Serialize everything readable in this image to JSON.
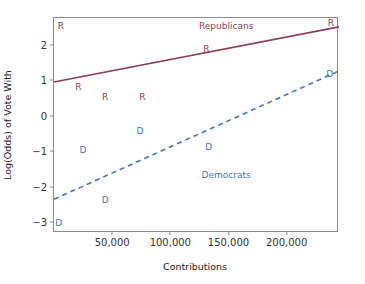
{
  "chart_data": {
    "type": "scatter",
    "title": "",
    "xlabel": "Contributions",
    "ylabel": "Log(Odds) of Vote With",
    "xlim": [
      0,
      245000
    ],
    "ylim": [
      -3.3,
      2.75
    ],
    "xticks": [
      50000,
      100000,
      150000,
      200000
    ],
    "xtick_labels": [
      "50,000",
      "100,000",
      "150,000",
      "200,000"
    ],
    "yticks": [
      2,
      1,
      0,
      -1,
      -2,
      -3
    ],
    "ytick_labels": [
      "2",
      "1",
      "0",
      "−1",
      "−2",
      "−3"
    ],
    "grid": false,
    "legend_position": "inline-annotations",
    "colors": {
      "republican": "#8e4055",
      "democrat": "#4176c4",
      "axis": "#8a8a92",
      "text": "#222228",
      "background": "#ffffff"
    },
    "annotations": [
      {
        "text": "Republicans",
        "x": 148000,
        "y": 2.53,
        "series": "Republicans"
      },
      {
        "text": "Democrats",
        "x": 148000,
        "y": -1.68,
        "series": "Democrats"
      }
    ],
    "series": [
      {
        "name": "Republicans",
        "marker_label": "R",
        "color": "#8e4055",
        "line_style": "solid",
        "points": [
          {
            "label": "R",
            "x": 6000,
            "y": 2.53
          },
          {
            "label": "R",
            "x": 238000,
            "y": 2.62
          },
          {
            "label": "R",
            "x": 131000,
            "y": 1.89
          },
          {
            "label": "R",
            "x": 21000,
            "y": 0.82
          },
          {
            "label": "R",
            "x": 44000,
            "y": 0.53
          },
          {
            "label": "R",
            "x": 76000,
            "y": 0.54
          }
        ],
        "fit_line": {
          "x0": 0,
          "y0": 0.95,
          "x1": 245000,
          "y1": 2.5
        }
      },
      {
        "name": "Democrats",
        "marker_label": "D",
        "color": "#4176c4",
        "line_style": "dashed",
        "points": [
          {
            "label": "D",
            "x": 74000,
            "y": -0.43
          },
          {
            "label": "D",
            "x": 25000,
            "y": -0.96
          },
          {
            "label": "D",
            "x": 133000,
            "y": -0.87
          },
          {
            "label": "D",
            "x": 237000,
            "y": 1.18
          },
          {
            "label": "D",
            "x": 44000,
            "y": -2.38
          },
          {
            "label": "D",
            "x": 4000,
            "y": -3.02
          }
        ],
        "fit_line": {
          "x0": 0,
          "y0": -2.35,
          "x1": 245000,
          "y1": 1.26
        }
      }
    ]
  }
}
